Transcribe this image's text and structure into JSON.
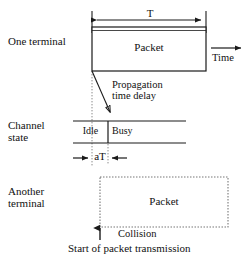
{
  "diagram": {
    "rows": [
      {
        "id": "one-terminal",
        "label": "One terminal"
      },
      {
        "id": "channel-state",
        "label": "Channel\nstate"
      },
      {
        "id": "another-terminal",
        "label": "Another\nterminal"
      }
    ],
    "one_terminal": {
      "packet_label": "Packet",
      "duration_label": "T",
      "time_axis_label": "Time"
    },
    "propagation": {
      "annotation": "Propagation\ntime delay"
    },
    "channel_state": {
      "idle_label": "Idle",
      "busy_label": "Busy",
      "delay_label": "aT"
    },
    "another_terminal": {
      "packet_label": "Packet",
      "collision_label": "Collision",
      "caption": "Start of packet transmission"
    },
    "colors": {
      "stroke": "#1a1a1a",
      "dotted": "#8a8a8a",
      "background": "#ffffff"
    }
  }
}
